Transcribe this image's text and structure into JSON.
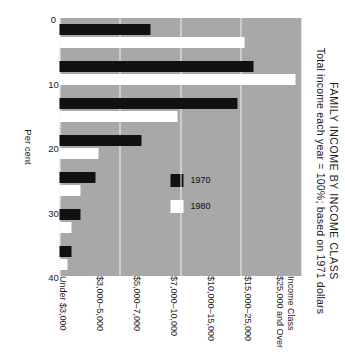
{
  "chart_data": {
    "type": "bar",
    "orientation": "vertical-grouped-rotated",
    "title": "FAMILY INCOME BY INCOME CLASS",
    "subtitle": "Total income each year = 100%; based on 1971 dollars",
    "xlabel": "Income Class",
    "ylabel": "Per cent",
    "ylim": [
      0,
      40
    ],
    "yticks": [
      0,
      10,
      20,
      30,
      40
    ],
    "ytick_labels": [
      "0",
      "10",
      "20",
      "30",
      "40"
    ],
    "grid": true,
    "legend_position": "inside-right",
    "plot_background": "#a8a8a8",
    "categories": [
      "$25,000 and Over",
      "$15,000–25,000",
      "$10,000–15,000",
      "$7,000–10,000",
      "$5,000–7,000",
      "$3,000–5,000",
      "Under $3,000"
    ],
    "series": [
      {
        "name": "1970",
        "color": "#111111",
        "values": [
          15.0,
          32.0,
          29.5,
          13.5,
          6.0,
          3.5,
          2.0
        ]
      },
      {
        "name": "1980",
        "color": "#ffffff",
        "values": [
          30.5,
          39.0,
          19.5,
          6.5,
          3.5,
          2.0,
          1.3
        ]
      }
    ]
  },
  "axis": {
    "category_axis_label": "Income Class",
    "value_axis_label": "Per cent"
  },
  "legend": {
    "items": [
      {
        "label": "1970",
        "swatch": "black"
      },
      {
        "label": "1980",
        "swatch": "white"
      }
    ]
  }
}
